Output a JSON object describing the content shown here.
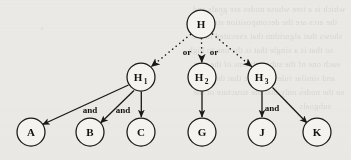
{
  "figure": {
    "background_color": "#f1f0ee",
    "ink_color": "#1b1915",
    "node_fill": "#fbfaf8"
  },
  "diagram": {
    "type": "and-or-tree",
    "nodes": [
      {
        "id": "H",
        "label": "H",
        "subscript": "",
        "cx": 201,
        "cy": 24,
        "r": 14,
        "level": 0
      },
      {
        "id": "H1",
        "label": "H",
        "subscript": "1",
        "cx": 141,
        "cy": 77,
        "r": 14,
        "level": 1
      },
      {
        "id": "H2",
        "label": "H",
        "subscript": "2",
        "cx": 202,
        "cy": 77,
        "r": 14,
        "level": 1
      },
      {
        "id": "H3",
        "label": "H",
        "subscript": "3",
        "cx": 262,
        "cy": 77,
        "r": 14,
        "level": 1
      },
      {
        "id": "A",
        "label": "A",
        "subscript": "",
        "cx": 31,
        "cy": 132,
        "r": 14,
        "level": 2
      },
      {
        "id": "B",
        "label": "B",
        "subscript": "",
        "cx": 90,
        "cy": 132,
        "r": 14,
        "level": 2
      },
      {
        "id": "C",
        "label": "C",
        "subscript": "",
        "cx": 141,
        "cy": 132,
        "r": 14,
        "level": 2
      },
      {
        "id": "G",
        "label": "G",
        "subscript": "",
        "cx": 202,
        "cy": 132,
        "r": 14,
        "level": 2
      },
      {
        "id": "J",
        "label": "J",
        "subscript": "",
        "cx": 262,
        "cy": 132,
        "r": 14,
        "level": 2
      },
      {
        "id": "K",
        "label": "K",
        "subscript": "",
        "cx": 317,
        "cy": 132,
        "r": 14,
        "level": 2
      }
    ],
    "edges": [
      {
        "from": "H",
        "to": "H1",
        "style": "dotted",
        "arrow": true,
        "label": ""
      },
      {
        "from": "H",
        "to": "H2",
        "style": "dotted",
        "arrow": true,
        "label": ""
      },
      {
        "from": "H",
        "to": "H3",
        "style": "dotted",
        "arrow": true,
        "label": ""
      },
      {
        "from": "H1",
        "to": "A",
        "style": "solid",
        "arrow": true,
        "label": "and"
      },
      {
        "from": "H1",
        "to": "B",
        "style": "solid",
        "arrow": true,
        "label": "and"
      },
      {
        "from": "H1",
        "to": "C",
        "style": "solid",
        "arrow": true,
        "label": ""
      },
      {
        "from": "H2",
        "to": "G",
        "style": "solid",
        "arrow": true,
        "label": ""
      },
      {
        "from": "H3",
        "to": "J",
        "style": "solid",
        "arrow": true,
        "label": "and"
      },
      {
        "from": "H3",
        "to": "K",
        "style": "solid",
        "arrow": true,
        "label": ""
      }
    ],
    "edge_labels": [
      {
        "id": "or-left",
        "text": "or",
        "x": 187,
        "y": 55
      },
      {
        "id": "or-right",
        "text": "or",
        "x": 214,
        "y": 55
      },
      {
        "id": "and-a",
        "text": "and",
        "x": 90,
        "y": 113
      },
      {
        "id": "and-b",
        "text": "and",
        "x": 123,
        "y": 113
      },
      {
        "id": "and-j",
        "text": "and",
        "x": 272,
        "y": 111
      }
    ]
  },
  "bleed_text": {
    "lines": [
      "which is a tree whose nodes are goals and",
      "the arcs are the decomposition steps and",
      "shows that algorithm that executed in the",
      "so that is a single that is the one to high",
      "each one of the sub problems of the tree",
      "and similar rules of logic that the tree",
      "so the nodes only that the structure of the",
      "subgoals"
    ]
  }
}
